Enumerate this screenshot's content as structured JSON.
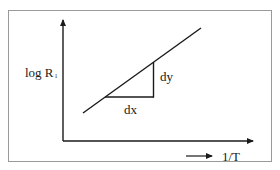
{
  "diagram": {
    "type": "log-plot-slope",
    "y_axis": {
      "label": "log R",
      "subscript": "1"
    },
    "x_axis": {
      "label": "1/T",
      "arrow": "long-right-arrow"
    },
    "triangle": {
      "horizontal_label": "dx",
      "vertical_label": "dy"
    },
    "colors": {
      "line": "#1a1a1a",
      "frame": "#9a9a9a",
      "background": "#ffffff"
    }
  }
}
